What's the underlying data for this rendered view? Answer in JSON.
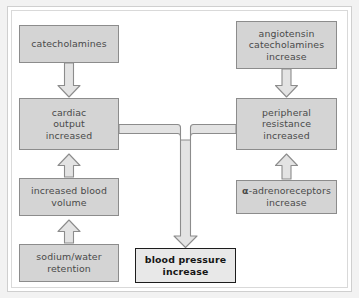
{
  "figure": {
    "background_color": "#f2f2f2",
    "canvas_color": "#ffffff"
  },
  "style": {
    "node_fill": "#d4d4d4",
    "node_border": "#8c8c8c",
    "node_text_color": "#4a4a4a",
    "outcome_fill": "#e8e8e8",
    "outcome_border": "#1d1d1d",
    "outcome_text_color": "#151515",
    "arrow_fill": "#e3e3e3",
    "arrow_stroke": "#8c8c8c"
  },
  "nodes": {
    "catecholamines": {
      "label": "catecholamines"
    },
    "angiotensin": {
      "label": "angiotensin\ncatecholamines\nincrease"
    },
    "cardiac_output": {
      "label": "cardiac\noutput\nincreased"
    },
    "peripheral_resistance": {
      "label": "peripheral\nresistance\nincreased"
    },
    "blood_volume": {
      "label": "increased blood\nvolume"
    },
    "adrenoreceptors": {
      "label_alpha": "α",
      "label_rest": "-adrenoreceptors\nincrease"
    },
    "sodium_water": {
      "label": "sodium/water\nretention"
    },
    "blood_pressure": {
      "label": "blood pressure\nincrease"
    }
  },
  "connectors": [
    {
      "name": "catecholamines-to-cardiac-output",
      "from": "catecholamines",
      "to": "cardiac_output",
      "direction": "down"
    },
    {
      "name": "angiotensin-to-peripheral-resistance",
      "from": "angiotensin",
      "to": "peripheral_resistance",
      "direction": "down"
    },
    {
      "name": "blood-volume-to-cardiac-output",
      "from": "blood_volume",
      "to": "cardiac_output",
      "direction": "up"
    },
    {
      "name": "sodium-water-to-blood-volume",
      "from": "sodium_water",
      "to": "blood_volume",
      "direction": "up"
    },
    {
      "name": "adrenoreceptors-to-peripheral-resistance",
      "from": "adrenoreceptors",
      "to": "peripheral_resistance",
      "direction": "up"
    },
    {
      "name": "cardiac-output-and-peripheral-resistance-to-blood-pressure",
      "from": "cardiac_output, peripheral_resistance",
      "to": "blood_pressure",
      "direction": "merge-down"
    }
  ]
}
